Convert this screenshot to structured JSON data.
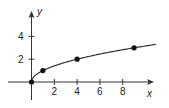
{
  "chart_data": {
    "type": "line",
    "title": "",
    "xlabel": "x",
    "ylabel": "y",
    "function": "y = sqrt(x)",
    "x": [
      0,
      1,
      4,
      9
    ],
    "series": [
      {
        "name": "y = √x",
        "values": [
          0,
          1,
          2,
          3
        ],
        "markers": true
      }
    ],
    "curve_domain": [
      0,
      10.9
    ],
    "xticks": [
      2,
      4,
      6,
      8
    ],
    "yticks": [
      2,
      4
    ],
    "xtick_labels": [
      "2",
      "4",
      "6",
      "8"
    ],
    "ytick_labels": [
      "2",
      "4"
    ],
    "xlim": [
      -1.5,
      10.9
    ],
    "ylim": [
      -1,
      6
    ],
    "grid": false,
    "legend": "none",
    "colors": {
      "line": "#333333",
      "marker": "#111111",
      "axis": "#333333"
    }
  }
}
